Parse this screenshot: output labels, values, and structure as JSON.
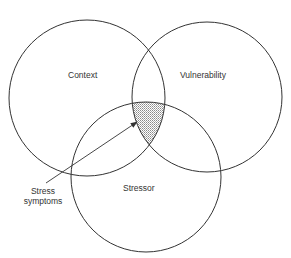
{
  "diagram": {
    "type": "venn",
    "circles": [
      {
        "label": "Context",
        "cx": 87,
        "cy": 98,
        "r": 78
      },
      {
        "label": "Vulnerability",
        "cx": 207,
        "cy": 97,
        "r": 75
      },
      {
        "label": "Stressor",
        "cx": 146,
        "cy": 177,
        "r": 75
      }
    ],
    "intersection": {
      "label_line1": "Stress",
      "label_line2": "symptoms",
      "fill": "dotted-gray"
    },
    "colors": {
      "stroke": "#333333",
      "shade": "#9a9a9a",
      "background": "#ffffff"
    }
  }
}
